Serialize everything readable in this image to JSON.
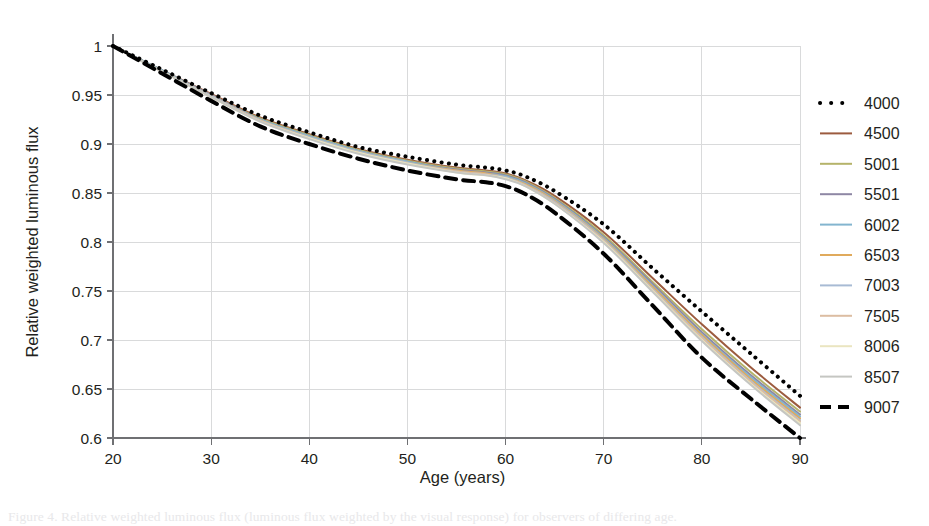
{
  "figure": {
    "background": "#ffffff",
    "text_color": "#231f20",
    "grid_color": "#d9dadb",
    "axis_color": "#6f7073"
  },
  "caption": {
    "text": "Figure 4. Relative weighted luminous flux (luminous flux weighted by the visual response) for observers of differing age."
  },
  "chart_data": {
    "type": "line",
    "title": "",
    "subtitle": "",
    "xlabel": "Age (years)",
    "ylabel": "Relative weighted luminous flux",
    "xlim": [
      20,
      90
    ],
    "ylim": [
      0.6,
      1.0
    ],
    "xticks": [
      20,
      30,
      40,
      50,
      60,
      70,
      80,
      90
    ],
    "xtick_labels": [
      "20",
      "30",
      "40",
      "50",
      "60",
      "70",
      "80",
      "90"
    ],
    "yticks": [
      0.6,
      0.65,
      0.7,
      0.75,
      0.8,
      0.85,
      0.9,
      0.95,
      1
    ],
    "ytick_labels": [
      "0.6",
      "0.65",
      "0.7",
      "0.75",
      "0.8",
      "0.85",
      "0.9",
      "0.95",
      "1"
    ],
    "grid": true,
    "grid_axis": "both",
    "legend_position": "right-outside",
    "annotations": [],
    "x": [
      20,
      25,
      30,
      35,
      40,
      45,
      50,
      55,
      58,
      60,
      62,
      65,
      70,
      75,
      80,
      85,
      90
    ],
    "series": [
      {
        "name": "4000",
        "label": "4000",
        "color": "#000000",
        "style": "dotted",
        "linewidth": 4.0,
        "values": [
          1.0,
          0.976,
          0.952,
          0.929,
          0.912,
          0.897,
          0.887,
          0.879,
          0.876,
          0.873,
          0.867,
          0.852,
          0.818,
          0.773,
          0.729,
          0.686,
          0.643
        ]
      },
      {
        "name": "4500",
        "label": "4500",
        "color": "#9c5b3f",
        "style": "solid",
        "linewidth": 2.0,
        "values": [
          1.0,
          0.975,
          0.951,
          0.927,
          0.91,
          0.895,
          0.884,
          0.876,
          0.873,
          0.87,
          0.863,
          0.847,
          0.81,
          0.763,
          0.716,
          0.672,
          0.631
        ]
      },
      {
        "name": "5001",
        "label": "5001",
        "color": "#b5b36a",
        "style": "solid",
        "linewidth": 2.0,
        "values": [
          1.0,
          0.975,
          0.95,
          0.926,
          0.909,
          0.894,
          0.883,
          0.875,
          0.872,
          0.869,
          0.862,
          0.845,
          0.807,
          0.759,
          0.711,
          0.667,
          0.627
        ]
      },
      {
        "name": "5501",
        "label": "5501",
        "color": "#8e87a4",
        "style": "solid",
        "linewidth": 2.0,
        "values": [
          1.0,
          0.975,
          0.95,
          0.925,
          0.908,
          0.893,
          0.882,
          0.874,
          0.871,
          0.868,
          0.861,
          0.844,
          0.805,
          0.757,
          0.708,
          0.664,
          0.624
        ]
      },
      {
        "name": "6002",
        "label": "6002",
        "color": "#83b5cf",
        "style": "solid",
        "linewidth": 2.0,
        "values": [
          1.0,
          0.975,
          0.949,
          0.925,
          0.908,
          0.893,
          0.882,
          0.873,
          0.87,
          0.867,
          0.86,
          0.843,
          0.804,
          0.755,
          0.706,
          0.662,
          0.622
        ]
      },
      {
        "name": "6503",
        "label": "6503",
        "color": "#e0aa5c",
        "style": "solid",
        "linewidth": 2.0,
        "values": [
          1.0,
          0.974,
          0.949,
          0.924,
          0.907,
          0.892,
          0.881,
          0.873,
          0.87,
          0.866,
          0.859,
          0.842,
          0.803,
          0.754,
          0.705,
          0.66,
          0.62
        ]
      },
      {
        "name": "7003",
        "label": "7003",
        "color": "#a8bbd4",
        "style": "solid",
        "linewidth": 2.0,
        "values": [
          1.0,
          0.974,
          0.949,
          0.924,
          0.907,
          0.892,
          0.881,
          0.872,
          0.869,
          0.866,
          0.858,
          0.841,
          0.802,
          0.752,
          0.703,
          0.658,
          0.618
        ]
      },
      {
        "name": "7505",
        "label": "7505",
        "color": "#dcbda2",
        "style": "solid",
        "linewidth": 2.0,
        "values": [
          1.0,
          0.974,
          0.948,
          0.924,
          0.906,
          0.891,
          0.88,
          0.872,
          0.869,
          0.865,
          0.858,
          0.84,
          0.801,
          0.751,
          0.702,
          0.657,
          0.617
        ]
      },
      {
        "name": "8006",
        "label": "8006",
        "color": "#eae5c0",
        "style": "solid",
        "linewidth": 2.0,
        "values": [
          1.0,
          0.974,
          0.948,
          0.923,
          0.906,
          0.891,
          0.88,
          0.871,
          0.868,
          0.865,
          0.857,
          0.839,
          0.8,
          0.75,
          0.7,
          0.655,
          0.615
        ]
      },
      {
        "name": "8507",
        "label": "8507",
        "color": "#c5c6c2",
        "style": "solid",
        "linewidth": 2.0,
        "values": [
          1.0,
          0.974,
          0.948,
          0.923,
          0.905,
          0.89,
          0.879,
          0.871,
          0.868,
          0.864,
          0.857,
          0.839,
          0.799,
          0.749,
          0.699,
          0.654,
          0.613
        ]
      },
      {
        "name": "9007",
        "label": "9007",
        "color": "#000000",
        "style": "dashed",
        "linewidth": 4.0,
        "values": [
          1.0,
          0.972,
          0.944,
          0.918,
          0.9,
          0.885,
          0.873,
          0.864,
          0.861,
          0.857,
          0.849,
          0.83,
          0.788,
          0.735,
          0.682,
          0.64,
          0.6
        ]
      }
    ]
  }
}
